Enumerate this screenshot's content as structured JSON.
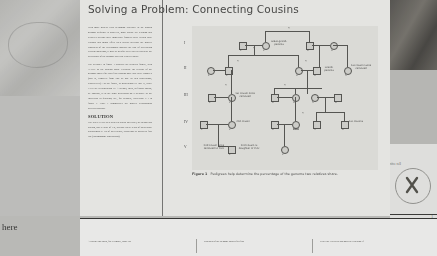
{
  "article": {
    "title": "Solving a Problem: Connecting Cousins",
    "solution_heading": "SOLUTION",
    "paragraphs": [
      "With more genetic tests becoming available as the human genome sequence is analyzed, more people are learning that relatives beyond their immediate families have certain gene variants that might affect their health. Because the genetic closeness of the relationship impacts the risk of developing certain conditions, it may be helpful to be able to calculate the percentage of the genome that two relatives share.",
      "The pedigree in figure 1 displays an extended family, with \"YOU\" as the starting point. Calculate the percent of the genome shared for your first cousins once and twice removed (that is, removed from you by one or two generations, respectively)—in the figure, in generations III and II, while YOU are in generation IV. A second, third, or fourth cousin, by contrast, is in the same generation on a pedigree as the individual in question; see, for example, individual V-1 in figure 1. Table 1 summarizes the genetic relationships between cousins."
    ],
    "solution_text": "The rules: Every step between parent and child, or sibling and sibling, has a value of 1/2, because these types of pairs share approximately 1/2 of their genes, according to Mendel's first law (chromosome segregation)."
  },
  "figure": {
    "caption_number": "Figure 1",
    "caption_text": "Pedigrees help determine the percentage of the genome two relatives share.",
    "generations": [
      "I",
      "II",
      "III",
      "IV",
      "V"
    ],
    "labels": [
      {
        "id": "great-grandparents",
        "text": "Great-grand-parents"
      },
      {
        "id": "grandparents",
        "text": "Grand-parents"
      },
      {
        "id": "first-cousin-twice-removed",
        "text": "1st cousin twice removed"
      },
      {
        "id": "first-cousin-once-removed",
        "text": "1st cousin once removed"
      },
      {
        "id": "first-cousins",
        "text": "1st cousins"
      },
      {
        "id": "second-cousin",
        "text": "2nd cousin"
      },
      {
        "id": "you",
        "text": "YOU"
      },
      {
        "id": "second-cousin-once-removed",
        "text": "2nd cousin once removed to YOU"
      },
      {
        "id": "second-cousin-daughter",
        "text": "2nd cousin is daughter of YOU"
      }
    ],
    "fraction": "½",
    "individual_numbers": [
      "1",
      "2",
      "3",
      "4",
      "5",
      "6"
    ]
  },
  "bottom": {
    "col1": "A parent and child, for example, share 50",
    "col2": "centages of the genome shared for first",
    "col3": "ed by the expected phenotypic variation if",
    "left_fragment": "here"
  },
  "margin": {
    "chromosome_caption": "ctive cell",
    "page_number": "1"
  }
}
